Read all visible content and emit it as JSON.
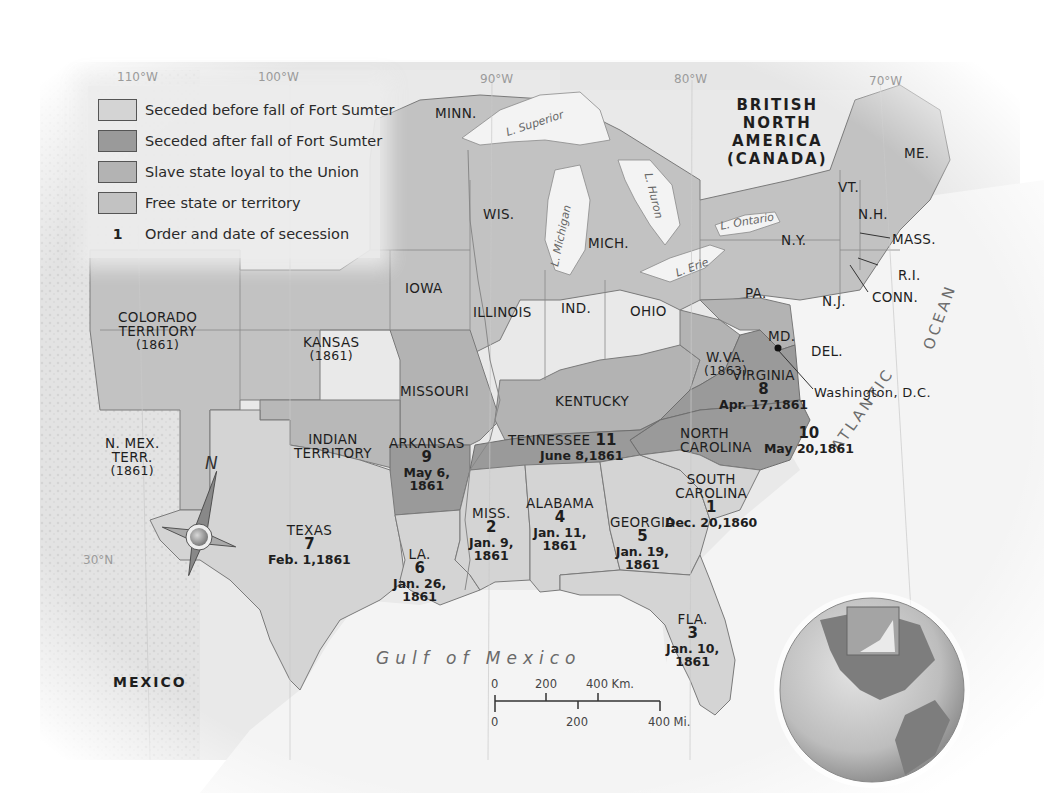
{
  "legend": {
    "items": [
      {
        "label": "Seceded before fall of Fort Sumter",
        "color": "#d4d4d4"
      },
      {
        "label": "Seceded after fall of Fort Sumter",
        "color": "#9a9a9a"
      },
      {
        "label": "Slave state loyal to the Union",
        "color": "#b3b3b3"
      },
      {
        "label": "Free state or territory",
        "color": "#c2c2c2"
      }
    ],
    "order_marker": "1",
    "order_label": "Order and date of secession"
  },
  "colors": {
    "seceded_before": "#d4d4d4",
    "seceded_after": "#9a9a9a",
    "slave_loyal": "#b3b3b3",
    "free": "#c2c2c2",
    "water": "#f3f3f3",
    "foreign_land": "#e6e6e6",
    "border": "#7a7a7a"
  },
  "longitudes": [
    "110°W",
    "100°W",
    "90°W",
    "80°W",
    "70°W"
  ],
  "latitude": "30°N",
  "countries": {
    "canada_line1": "BRITISH",
    "canada_line2": "NORTH",
    "canada_line3": "AMERICA",
    "canada_line4": "(CANADA)",
    "mexico": "MEXICO"
  },
  "water_labels": {
    "superior": "L. Superior",
    "michigan": "L. Michigan",
    "huron": "L. Huron",
    "ontario": "L. Ontario",
    "erie": "L. Erie",
    "gulf": "Gulf of Mexico",
    "atlantic": "ATLANTIC",
    "ocean": "OCEAN"
  },
  "states": {
    "minn": "MINN.",
    "wis": "WIS.",
    "mich": "MICH.",
    "iowa": "IOWA",
    "illinois": "ILLINOIS",
    "ind": "IND.",
    "ohio": "OHIO",
    "ny": "N.Y.",
    "pa": "PA.",
    "nj": "N.J.",
    "me": "ME.",
    "vt": "VT.",
    "nh": "N.H.",
    "mass": "MASS.",
    "ri": "R.I.",
    "conn": "CONN.",
    "md": "MD.",
    "del": "DEL.",
    "dc": "Washington, D.C.",
    "colorado_1": "COLORADO",
    "colorado_2": "TERRITORY",
    "colorado_year": "(1861)",
    "kansas": "KANSAS",
    "kansas_year": "(1861)",
    "missouri": "MISSOURI",
    "kentucky": "KENTUCKY",
    "wva": "W.VA.",
    "wva_year": "(1863)",
    "nmex_1": "N. MEX.",
    "nmex_2": "TERR.",
    "nmex_year": "(1861)",
    "indian_1": "INDIAN",
    "indian_2": "TERRITORY"
  },
  "seceded": [
    {
      "state": "SOUTH CAROLINA",
      "order": "1",
      "date": "Dec. 20,1860"
    },
    {
      "state": "MISS.",
      "order": "2",
      "date": "Jan. 9, 1861"
    },
    {
      "state": "FLA.",
      "order": "3",
      "date": "Jan. 10, 1861"
    },
    {
      "state": "ALABAMA",
      "order": "4",
      "date": "Jan. 11, 1861"
    },
    {
      "state": "GEORGIA",
      "order": "5",
      "date": "Jan. 19, 1861"
    },
    {
      "state": "LA.",
      "order": "6",
      "date": "Jan. 26, 1861"
    },
    {
      "state": "TEXAS",
      "order": "7",
      "date": "Feb. 1,1861"
    },
    {
      "state": "VIRGINIA",
      "order": "8",
      "date": "Apr. 17,1861"
    },
    {
      "state": "ARKANSAS",
      "order": "9",
      "date": "May 6, 1861"
    },
    {
      "state": "NORTH CAROLINA",
      "order": "10",
      "date": "May 20,1861"
    },
    {
      "state": "TENNESSEE",
      "order": "11",
      "date": "June 8,1861"
    }
  ],
  "seceded_display": {
    "sc_1": "SOUTH",
    "sc_2": "CAROLINA",
    "sc_ord": "1",
    "sc_date": "Dec. 20,1860",
    "ms_name": "MISS.",
    "ms_ord": "2",
    "ms_d1": "Jan. 9,",
    "ms_d2": "1861",
    "fl_name": "FLA.",
    "fl_ord": "3",
    "fl_d1": "Jan. 10,",
    "fl_d2": "1861",
    "al_name": "ALABAMA",
    "al_ord": "4",
    "al_d1": "Jan. 11,",
    "al_d2": "1861",
    "ga_name": "GEORGIA",
    "ga_ord": "5",
    "ga_d1": "Jan. 19,",
    "ga_d2": "1861",
    "la_name": "LA.",
    "la_ord": "6",
    "la_d1": "Jan. 26,",
    "la_d2": "1861",
    "tx_name": "TEXAS",
    "tx_ord": "7",
    "tx_date": "Feb. 1,1861",
    "va_name": "VIRGINIA",
    "va_ord": "8",
    "va_date": "Apr. 17,1861",
    "ar_name": "ARKANSAS",
    "ar_ord": "9",
    "ar_d1": "May 6,",
    "ar_d2": "1861",
    "nc_1": "NORTH",
    "nc_2": "CAROLINA",
    "nc_ord": "10",
    "nc_date": "May 20,1861",
    "tn_name": "TENNESSEE",
    "tn_ord": "11",
    "tn_date": "June 8,1861"
  },
  "compass": {
    "north_label": "N"
  },
  "scale": {
    "km_ticks": [
      "0",
      "200",
      "400 Km."
    ],
    "mi_ticks": [
      "0",
      "200",
      "400 Mi."
    ]
  }
}
